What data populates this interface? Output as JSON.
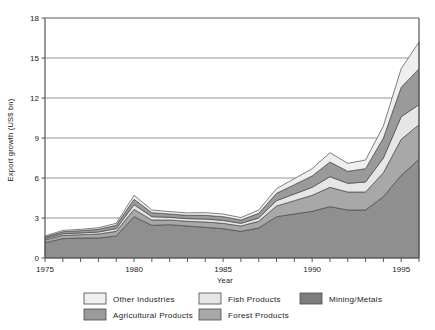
{
  "chart_data": {
    "type": "area",
    "stacked": true,
    "title": "",
    "xlabel": "Year",
    "ylabel": "Export growth (US$ bn)",
    "xlim": [
      1975,
      1996
    ],
    "ylim": [
      0,
      18
    ],
    "yticks": [
      0,
      3,
      6,
      9,
      12,
      15,
      18
    ],
    "ytick_labels": [
      "0",
      "3",
      "6",
      "9",
      "12",
      "15",
      "18"
    ],
    "xticks": [
      1975,
      1976,
      1977,
      1978,
      1979,
      1980,
      1981,
      1982,
      1983,
      1984,
      1985,
      1986,
      1987,
      1988,
      1989,
      1990,
      1991,
      1992,
      1993,
      1994,
      1995,
      1996
    ],
    "xtick_labels_shown": [
      "1975",
      "1980",
      "1985",
      "1990",
      "1995"
    ],
    "xtick_labels_positions": [
      1975,
      1980,
      1985,
      1990,
      1995
    ],
    "grid": "horizontal",
    "legend_position": "bottom",
    "x": [
      1975,
      1976,
      1977,
      1978,
      1979,
      1980,
      1981,
      1982,
      1983,
      1984,
      1985,
      1986,
      1987,
      1988,
      1989,
      1990,
      1991,
      1992,
      1993,
      1994,
      1995,
      1996
    ],
    "series": [
      {
        "name": "Mining/Metals",
        "color": "#8f8f8f",
        "order": 1,
        "values": [
          1.15,
          1.45,
          1.5,
          1.5,
          1.65,
          3.1,
          2.45,
          2.5,
          2.4,
          2.3,
          2.2,
          2.0,
          2.25,
          3.1,
          3.3,
          3.5,
          3.85,
          3.6,
          3.6,
          4.6,
          6.2,
          7.4
        ]
      },
      {
        "name": "Forest Products",
        "color": "#a8a8a8",
        "order": 2,
        "values": [
          0.2,
          0.25,
          0.25,
          0.3,
          0.35,
          0.55,
          0.4,
          0.35,
          0.35,
          0.4,
          0.4,
          0.4,
          0.5,
          0.8,
          1.0,
          1.2,
          1.45,
          1.35,
          1.35,
          1.8,
          2.7,
          2.6
        ]
      },
      {
        "name": "Fish Products",
        "color": "#e6e6e6",
        "order": 3,
        "values": [
          0.1,
          0.12,
          0.13,
          0.15,
          0.2,
          0.35,
          0.25,
          0.2,
          0.2,
          0.22,
          0.22,
          0.2,
          0.25,
          0.4,
          0.5,
          0.6,
          0.8,
          0.65,
          0.75,
          1.1,
          1.7,
          1.5
        ]
      },
      {
        "name": "Agricultural Products",
        "color": "#9a9a9a",
        "order": 4,
        "values": [
          0.12,
          0.15,
          0.17,
          0.2,
          0.25,
          0.4,
          0.3,
          0.25,
          0.25,
          0.28,
          0.28,
          0.25,
          0.35,
          0.55,
          0.7,
          0.85,
          1.1,
          0.9,
          1.0,
          1.5,
          2.2,
          2.7
        ]
      },
      {
        "name": "Other Industries",
        "color": "#efefef",
        "order": 5,
        "values": [
          0.08,
          0.1,
          0.1,
          0.12,
          0.15,
          0.3,
          0.2,
          0.18,
          0.18,
          0.2,
          0.2,
          0.18,
          0.25,
          0.35,
          0.45,
          0.55,
          0.7,
          0.6,
          0.65,
          0.9,
          1.4,
          2.0
        ]
      }
    ]
  },
  "axes": {
    "ylabel": "Export growth (US$ bn)",
    "xlabel": "Year"
  },
  "legend": {
    "items": [
      {
        "label": "Other Industries",
        "color": "#efefef",
        "column": 1,
        "row": 1
      },
      {
        "label": "Agricultural Products",
        "color": "#9a9a9a",
        "column": 1,
        "row": 2
      },
      {
        "label": "Fish Products",
        "color": "#e6e6e6",
        "column": 2,
        "row": 1
      },
      {
        "label": "Forest Products",
        "color": "#a8a8a8",
        "column": 2,
        "row": 2
      },
      {
        "label": "Mining/Metals",
        "color": "#7d7d7d",
        "column": 3,
        "row": 1
      }
    ]
  },
  "colors": {
    "axis": "#555555",
    "grid": "#888888",
    "outline": "#4a4a4a",
    "background": "#ffffff"
  }
}
